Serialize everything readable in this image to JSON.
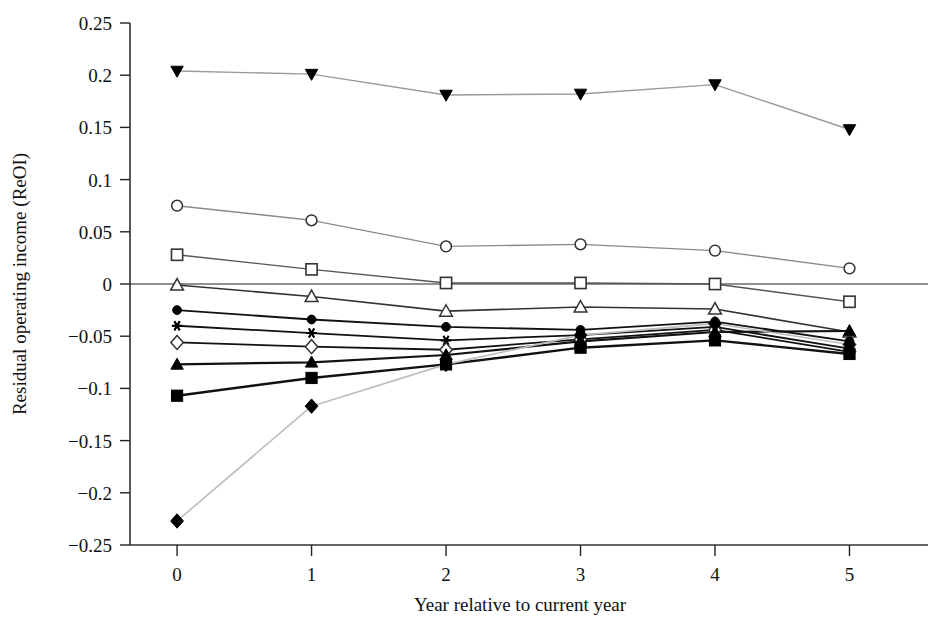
{
  "chart_data": {
    "type": "line",
    "title": "",
    "xlabel": "Year relative to current year",
    "ylabel": "Residual operating income (ReOI)",
    "x": [
      0,
      1,
      2,
      3,
      4,
      5
    ],
    "xtick_labels": [
      "0",
      "1",
      "2",
      "3",
      "4",
      "5"
    ],
    "ytick_labels": [
      "0.25",
      "0.2",
      "0.15",
      "0.1",
      "0.05",
      "0",
      "-0.05",
      "-0.1",
      "-0.15",
      "-0.2",
      "-0.25"
    ],
    "ytick_values": [
      0.25,
      0.2,
      0.15,
      0.1,
      0.05,
      0,
      -0.05,
      -0.1,
      -0.15,
      -0.2,
      -0.25
    ],
    "xlim": [
      -0.35,
      5.45
    ],
    "ylim": [
      -0.25,
      0.25
    ],
    "grid": false,
    "legend": "none",
    "zero_line": true,
    "series": [
      {
        "name": "portfolio-10",
        "marker": "filled-triangle-down",
        "line_color": "#9a9a9a",
        "line_width": 1.4,
        "values": [
          0.204,
          0.201,
          0.181,
          0.182,
          0.191,
          0.148
        ]
      },
      {
        "name": "portfolio-9",
        "marker": "open-circle",
        "line_color": "#8a8a8a",
        "line_width": 1.4,
        "values": [
          0.075,
          0.061,
          0.036,
          0.038,
          0.032,
          0.015
        ]
      },
      {
        "name": "portfolio-8",
        "marker": "open-square",
        "line_color": "#555555",
        "line_width": 1.4,
        "values": [
          0.028,
          0.014,
          0.001,
          0.001,
          0.0,
          -0.017
        ]
      },
      {
        "name": "portfolio-7",
        "marker": "open-triangle-up",
        "line_color": "#333333",
        "line_width": 1.6,
        "values": [
          -0.001,
          -0.012,
          -0.026,
          -0.022,
          -0.024,
          -0.046
        ]
      },
      {
        "name": "portfolio-6",
        "marker": "filled-circle",
        "line_color": "#111111",
        "line_width": 1.8,
        "values": [
          -0.025,
          -0.034,
          -0.041,
          -0.044,
          -0.036,
          -0.055
        ]
      },
      {
        "name": "portfolio-5",
        "marker": "asterisk",
        "line_color": "#111111",
        "line_width": 1.8,
        "values": [
          -0.04,
          -0.047,
          -0.054,
          -0.049,
          -0.041,
          -0.062
        ]
      },
      {
        "name": "portfolio-4",
        "marker": "open-diamond",
        "line_color": "#111111",
        "line_width": 1.8,
        "values": [
          -0.056,
          -0.06,
          -0.063,
          -0.053,
          -0.044,
          -0.065
        ]
      },
      {
        "name": "portfolio-3",
        "marker": "filled-triangle-up",
        "line_color": "#111111",
        "line_width": 2.2,
        "values": [
          -0.077,
          -0.075,
          -0.068,
          -0.055,
          -0.046,
          -0.045
        ]
      },
      {
        "name": "portfolio-2",
        "marker": "filled-square",
        "line_color": "#111111",
        "line_width": 2.4,
        "values": [
          -0.107,
          -0.09,
          -0.077,
          -0.061,
          -0.054,
          -0.067
        ]
      },
      {
        "name": "portfolio-1",
        "marker": "filled-diamond",
        "line_color": "#bdbdbd",
        "line_width": 1.6,
        "values": [
          -0.227,
          -0.117,
          -0.077,
          -0.049,
          -0.038,
          -0.058
        ]
      }
    ]
  }
}
